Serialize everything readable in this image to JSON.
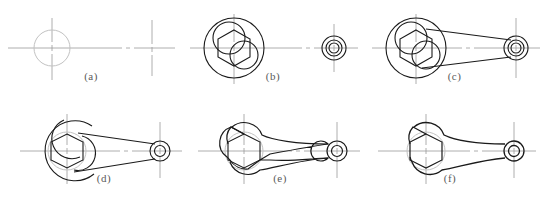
{
  "figure": {
    "kind": "engineering-construction-sequence",
    "panel_count": 6,
    "rows": 2,
    "columns": 3,
    "background_color": "#ffffff",
    "line_colors": {
      "object_line": "#1a1a1a",
      "construction_line": "#9a9a9a",
      "center_line": "#8a8a8a",
      "faint_construction": "#c2c2c2",
      "label_text": "#5a5a5a"
    }
  },
  "panels": [
    {
      "id": "a",
      "label": "(a)",
      "caption_text": "(a)",
      "step_no": 1,
      "description": "Lay out centre lines and the light construction circle for the wrench head, plus the centre cross for the small eye.",
      "elements": [
        "horizontal-centerline",
        "head-vertical-centerline",
        "head-construction-circle",
        "eye-center-cross"
      ],
      "head_center": {
        "x": 52,
        "y": 46
      },
      "eye_center": {
        "x": 152,
        "y": 46
      },
      "head_circle_radius": 18
    },
    {
      "id": "b",
      "label": "(b)",
      "caption_text": "(b)",
      "step_no": 2,
      "description": "Draw the outer head circle, the hexagon nut opening, the inner arc circles and the concentric circles of the small eye.",
      "elements": [
        "horizontal-centerline",
        "head-vertical-centerline",
        "head-outer-circle",
        "hexagon-opening",
        "jaw-arc-circle-upper",
        "jaw-arc-circle-lower",
        "eye-outer-circle",
        "eye-middle-circle",
        "eye-bore-circle",
        "eye-center-cross"
      ],
      "head_center": {
        "x": 52,
        "y": 46
      },
      "eye_center": {
        "x": 152,
        "y": 46
      },
      "head_outer_radius": 30,
      "hexagon_circumradius": 18,
      "eye_outer_radius": 12,
      "eye_middle_radius": 8,
      "eye_bore_radius": 5
    },
    {
      "id": "c",
      "label": "(c)",
      "caption_text": "(c)",
      "step_no": 3,
      "description": "Add the two straight tangent lines that form the tapered handle joining head to eye.",
      "elements": [
        "horizontal-centerline",
        "head-vertical-centerline",
        "head-outer-circle",
        "hexagon-opening",
        "jaw-arc-circle-upper",
        "jaw-arc-circle-lower",
        "handle-tangent-upper",
        "handle-tangent-lower",
        "eye-outer-circle",
        "eye-middle-circle",
        "eye-bore-circle",
        "eye-center-cross"
      ],
      "head_center": {
        "x": 52,
        "y": 46
      },
      "eye_center": {
        "x": 152,
        "y": 46
      }
    },
    {
      "id": "d",
      "label": "(d)",
      "caption_text": "(d)",
      "step_no": 4,
      "description": "Add the large outer head arc and the jaw fillet arcs; construction circles still visible.",
      "elements": [
        "horizontal-centerline",
        "head-vertical-centerline",
        "head-outline-arc",
        "head-construction-circle",
        "hexagon-opening",
        "jaw-arc-upper",
        "jaw-arc-lower",
        "handle-tangent-upper",
        "handle-tangent-lower",
        "eye-outer-circle",
        "eye-bore-circle",
        "eye-center-cross"
      ],
      "head_center": {
        "x": 55,
        "y": 51
      },
      "eye_center": {
        "x": 148,
        "y": 51
      }
    },
    {
      "id": "e",
      "label": "(e)",
      "caption_text": "(e)",
      "step_no": 5,
      "description": "Erase construction lines and darken the finished outline: rounded head with hexagon jaw, blended tapered handle, ringed eye.",
      "elements": [
        "horizontal-centerline",
        "head-vertical-centerline",
        "head-construction-circle",
        "hexagon-opening",
        "finished-outline",
        "eye-outer-circle",
        "eye-bore-circle",
        "eye-center-cross"
      ],
      "head_center": {
        "x": 52,
        "y": 51
      },
      "eye_center": {
        "x": 145,
        "y": 51
      }
    },
    {
      "id": "f",
      "label": "(f)",
      "caption_text": "(f)",
      "step_no": 6,
      "description": "Final drawing: all lines brought to full thickness, centre lines retained.",
      "elements": [
        "horizontal-centerline",
        "head-vertical-centerline",
        "head-construction-circle",
        "hexagon-opening",
        "finished-outline",
        "eye-outer-circle",
        "eye-bore-circle",
        "eye-center-cross"
      ],
      "head_center": {
        "x": 52,
        "y": 51
      },
      "eye_center": {
        "x": 140,
        "y": 51
      }
    }
  ]
}
